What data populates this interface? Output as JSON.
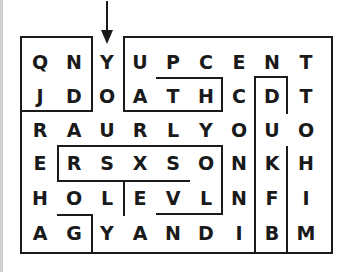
{
  "puzzle": {
    "type": "word-maze",
    "start_marker": "arrow-down",
    "grid": [
      [
        "Q",
        "N",
        "Y",
        "U",
        "P",
        "C",
        "E",
        "N",
        "T"
      ],
      [
        "J",
        "D",
        "O",
        "A",
        "T",
        "H",
        "C",
        "D",
        "T"
      ],
      [
        "R",
        "A",
        "U",
        "R",
        "L",
        "Y",
        "O",
        "U",
        "O"
      ],
      [
        "E",
        "R",
        "S",
        "X",
        "S",
        "O",
        "N",
        "K",
        "H"
      ],
      [
        "H",
        "O",
        "L",
        "E",
        "V",
        "L",
        "N",
        "F",
        "I"
      ],
      [
        "A",
        "G",
        "Y",
        "A",
        "N",
        "D",
        "I",
        "B",
        "M"
      ]
    ]
  },
  "colors": {
    "line": "#1a1a1a",
    "text": "#1a1a1a",
    "background": "#ffffff"
  }
}
